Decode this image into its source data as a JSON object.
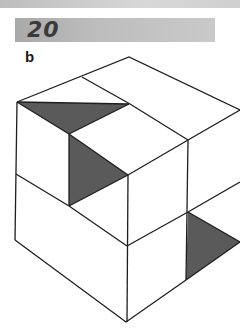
{
  "header": {
    "number": "20",
    "banner_color": "#b5b5b5",
    "number_color": "#3a3a3a"
  },
  "figure": {
    "label": "b",
    "stroke_color": "#1e1e1e",
    "shade_color": "#5a5a5a",
    "shaded_triangles": [
      {
        "name": "top-left-triangle",
        "points": [
          [
            17,
            102
          ],
          [
            129,
            104
          ],
          [
            69,
            134
          ]
        ]
      },
      {
        "name": "inner-face-triangle",
        "points": [
          [
            69,
            134
          ],
          [
            128,
            175
          ],
          [
            69,
            206
          ]
        ]
      },
      {
        "name": "lower-right-triangle",
        "points": [
          [
            188,
            212
          ],
          [
            240,
            242
          ],
          [
            186,
            280
          ]
        ]
      }
    ]
  }
}
